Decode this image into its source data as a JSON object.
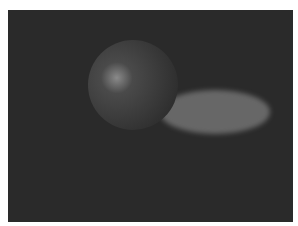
{
  "scene": {
    "title": "Ray-traced sphere on checkerboard plane",
    "colors": {
      "light_tile": "#8c8c8c",
      "dark_tile": "#2a2a2a",
      "sphere_base": "#4a4a4a",
      "sphere_highlight": "#8a8a8a",
      "sphere_edge": "#2e2e2e",
      "reflection_spot": "#9a9a9a",
      "horizon": "#b0b0b0",
      "frame": "#ffffff"
    },
    "checkerboard": {
      "rows_visible": 14,
      "columns_visible": 12
    },
    "objects": [
      {
        "type": "sphere",
        "label": "sphere",
        "material": "dark glossy"
      },
      {
        "type": "ellipse",
        "label": "light-spot",
        "material": "bright reflection on floor"
      }
    ]
  }
}
